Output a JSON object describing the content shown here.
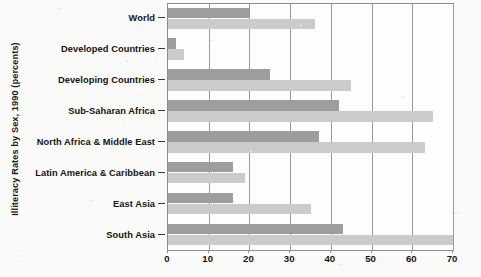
{
  "chart_data": {
    "type": "bar",
    "orientation": "horizontal",
    "title": "",
    "ylabel": "Illiteracy Rates by Sex, 1990 (percents)",
    "xlabel": "",
    "categories": [
      "World",
      "Developed Countries",
      "Developing Countries",
      "Sub-Saharan Africa",
      "North Africa & Middle East",
      "Latin America & Caribbean",
      "East Asia",
      "South Asia"
    ],
    "series": [
      {
        "name": "Male",
        "color": "#9d9d9d",
        "values": [
          20,
          2,
          25,
          42,
          37,
          16,
          16,
          43
        ]
      },
      {
        "name": "Female",
        "color": "#cbcbcb",
        "values": [
          36,
          4,
          45,
          65,
          63,
          19,
          35,
          70
        ]
      }
    ],
    "xticks": [
      0,
      10,
      20,
      30,
      40,
      50,
      60,
      70
    ],
    "xlim": [
      0,
      70
    ],
    "grid": true,
    "legend": "none"
  },
  "axis": {
    "tick_labels": [
      "0",
      "10",
      "20",
      "30",
      "40",
      "50",
      "60",
      "70"
    ]
  },
  "colors": {
    "bar_male": "#9d9d9d",
    "bar_female": "#cbcbcb",
    "axis": "#8d8d8d",
    "text": "#141414",
    "background": "#fafaf9"
  }
}
